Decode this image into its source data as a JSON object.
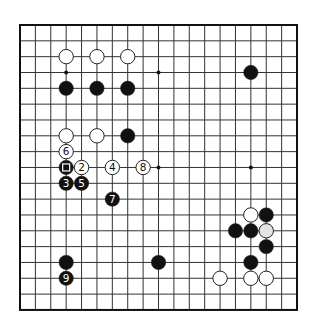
{
  "board": {
    "size": 19,
    "origin_x": 20,
    "origin_y": 25,
    "step_x": 15.39,
    "step_y": 15.83,
    "line_color": "#333333",
    "border_color": "#111111",
    "stone_radius": 7.2
  },
  "star_points": [
    [
      3,
      3
    ],
    [
      9,
      3
    ],
    [
      15,
      3
    ],
    [
      3,
      9
    ],
    [
      9,
      9
    ],
    [
      15,
      9
    ],
    [
      3,
      15
    ],
    [
      9,
      15
    ],
    [
      15,
      15
    ]
  ],
  "stones": [
    {
      "c": 3,
      "r": 2,
      "color": "white"
    },
    {
      "c": 5,
      "r": 2,
      "color": "white"
    },
    {
      "c": 7,
      "r": 2,
      "color": "white"
    },
    {
      "c": 3,
      "r": 4,
      "color": "black"
    },
    {
      "c": 5,
      "r": 4,
      "color": "black"
    },
    {
      "c": 7,
      "r": 4,
      "color": "black"
    },
    {
      "c": 15,
      "r": 3,
      "color": "black"
    },
    {
      "c": 3,
      "r": 7,
      "color": "white"
    },
    {
      "c": 5,
      "r": 7,
      "color": "white"
    },
    {
      "c": 7,
      "r": 7,
      "color": "black"
    },
    {
      "c": 3,
      "r": 9,
      "color": "black",
      "marker": "square"
    },
    {
      "c": 3,
      "r": 8,
      "color": "white",
      "label": "6"
    },
    {
      "c": 4,
      "r": 9,
      "color": "white",
      "label": "2"
    },
    {
      "c": 6,
      "r": 9,
      "color": "white",
      "label": "4"
    },
    {
      "c": 8,
      "r": 9,
      "color": "white",
      "label": "8"
    },
    {
      "c": 3,
      "r": 10,
      "color": "black",
      "label": "3"
    },
    {
      "c": 4,
      "r": 10,
      "color": "black",
      "label": "5"
    },
    {
      "c": 6,
      "r": 11,
      "color": "black",
      "label": "7"
    },
    {
      "c": 3,
      "r": 15,
      "color": "black"
    },
    {
      "c": 3,
      "r": 16,
      "color": "black",
      "label": "9"
    },
    {
      "c": 9,
      "r": 15,
      "color": "black"
    },
    {
      "c": 15,
      "r": 12,
      "color": "white"
    },
    {
      "c": 16,
      "r": 12,
      "color": "black"
    },
    {
      "c": 14,
      "r": 13,
      "color": "black"
    },
    {
      "c": 15,
      "r": 13,
      "color": "black"
    },
    {
      "c": 16,
      "r": 13,
      "color": "grey"
    },
    {
      "c": 16,
      "r": 14,
      "color": "black"
    },
    {
      "c": 15,
      "r": 15,
      "color": "black"
    },
    {
      "c": 13,
      "r": 16,
      "color": "white"
    },
    {
      "c": 15,
      "r": 16,
      "color": "white"
    },
    {
      "c": 16,
      "r": 16,
      "color": "white"
    }
  ]
}
